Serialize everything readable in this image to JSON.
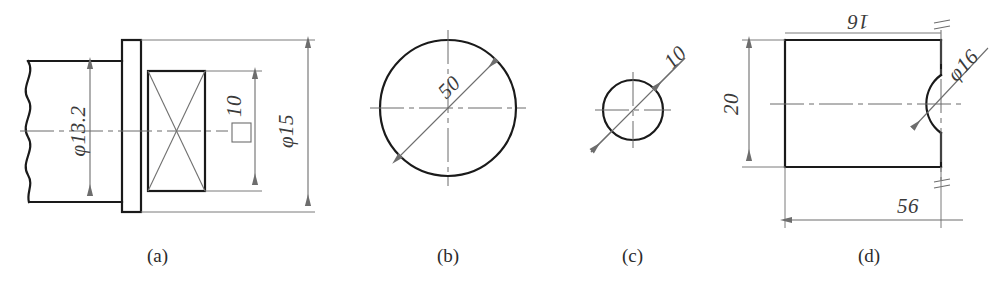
{
  "document": {
    "kind": "engineering-drawing-plate",
    "width": 997,
    "height": 296,
    "background_color": "#ffffff",
    "line_color": "#1a1a1a",
    "thin_line_color": "#6d6d6d"
  },
  "figures": [
    {
      "id": "a",
      "caption": "(a)",
      "description": "Shaft end with flange and square cross-section, broken left end",
      "dimensions": [
        {
          "name": "shaft-diameter",
          "text": "φ13.2",
          "orientation": "vertical",
          "value": 13.2,
          "symbol": "diameter"
        },
        {
          "name": "square-across-flats",
          "text": "10",
          "prefix_symbol": "square",
          "orientation": "vertical",
          "value": 10
        },
        {
          "name": "flange-diameter",
          "text": "φ15",
          "orientation": "vertical",
          "value": 15,
          "symbol": "diameter"
        }
      ]
    },
    {
      "id": "b",
      "caption": "(b)",
      "description": "Large circle with inclined diameter dimension",
      "dimensions": [
        {
          "name": "circle-diameter",
          "text": "50",
          "orientation": "inclined",
          "value": 50
        }
      ]
    },
    {
      "id": "c",
      "caption": "(c)",
      "description": "Small circle with inclined diameter dimension, arrows outside",
      "dimensions": [
        {
          "name": "circle-diameter",
          "text": "10",
          "orientation": "inclined",
          "value": 10
        }
      ]
    },
    {
      "id": "d",
      "caption": "(d)",
      "description": "Rectangular block with semicircular recess at right edge, symmetry marks",
      "dimensions": [
        {
          "name": "top-length",
          "text": "16",
          "orientation": "horizontal-inverted",
          "value": 16
        },
        {
          "name": "height",
          "text": "20",
          "orientation": "vertical",
          "value": 20
        },
        {
          "name": "hole-diameter",
          "text": "φ16",
          "orientation": "inclined",
          "value": 16,
          "symbol": "diameter"
        },
        {
          "name": "overall-length",
          "text": "56",
          "orientation": "horizontal",
          "value": 56
        }
      ]
    }
  ],
  "captions": {
    "a": "(a)",
    "b": "(b)",
    "c": "(c)",
    "d": "(d)"
  },
  "labels": {
    "a_shaft_dia": "φ13.2",
    "a_square": "10",
    "a_flange_dia": "φ15",
    "b_dia": "50",
    "c_dia": "10",
    "d_top": "16",
    "d_height": "20",
    "d_hole": "φ16",
    "d_length": "56"
  }
}
